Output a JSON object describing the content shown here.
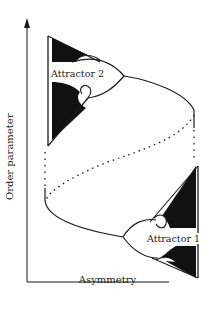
{
  "diagram": {
    "type": "bifurcation-diagram",
    "x_axis": {
      "label": "Asymmetry"
    },
    "y_axis": {
      "label": "Order parameter"
    },
    "annotations": [
      {
        "id": "attractor-2",
        "label": "Attractor 2",
        "position": "upper-left"
      },
      {
        "id": "attractor-1",
        "label": "Attractor 1",
        "position": "lower-right"
      }
    ],
    "curves": [
      {
        "name": "upper-stable-branch",
        "style": "solid"
      },
      {
        "name": "lower-stable-branch",
        "style": "solid"
      },
      {
        "name": "unstable-branch",
        "style": "dotted"
      }
    ],
    "colors": {
      "line": "#1a1a1a",
      "fill": "#111111",
      "background": "#ffffff"
    }
  }
}
